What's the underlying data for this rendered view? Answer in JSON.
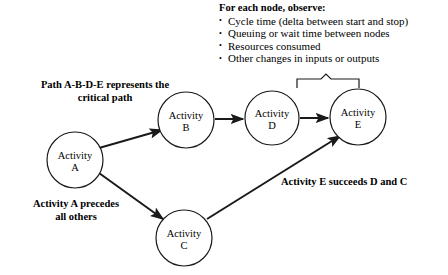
{
  "diagram": {
    "type": "process-flow-network",
    "stroke_color": "#1a1a1a",
    "node_fill": "#ffffff",
    "nodes": [
      {
        "id": "A",
        "line1": "Activity",
        "line2": "A",
        "cx": 75,
        "cy": 160,
        "r": 28
      },
      {
        "id": "B",
        "line1": "Activity",
        "line2": "B",
        "cx": 186,
        "cy": 120,
        "r": 28
      },
      {
        "id": "C",
        "line1": "Activity",
        "line2": "C",
        "cx": 184,
        "cy": 238,
        "r": 28
      },
      {
        "id": "D",
        "line1": "Activity",
        "line2": "D",
        "cx": 272,
        "cy": 118,
        "r": 27
      },
      {
        "id": "E",
        "line1": "Activity",
        "line2": "E",
        "cx": 358,
        "cy": 117,
        "r": 28
      }
    ],
    "edges": [
      {
        "from": "A",
        "to": "B",
        "x1": 99,
        "y1": 148,
        "x2": 162,
        "y2": 130
      },
      {
        "from": "A",
        "to": "C",
        "x1": 99,
        "y1": 173,
        "x2": 163,
        "y2": 219
      },
      {
        "from": "B",
        "to": "D",
        "x1": 215,
        "y1": 119,
        "x2": 243,
        "y2": 119
      },
      {
        "from": "D",
        "to": "E",
        "x1": 300,
        "y1": 118,
        "x2": 328,
        "y2": 118
      },
      {
        "from": "C",
        "to": "E",
        "x1": 207,
        "y1": 219,
        "x2": 340,
        "y2": 136
      }
    ],
    "bracket": {
      "label": "brace-over-d-and-e",
      "left_x": 297,
      "right_x": 359,
      "bar_y": 88,
      "tick_y": 79,
      "peak_x": 326,
      "peak_y": 74
    }
  },
  "annotations": {
    "critical_path": "Path A-B-D-E represents the\ncritical path",
    "precedes": "Activity A precedes\nall others",
    "succeeds": "Activity E succeeds D and C"
  },
  "observe": {
    "title": "For each node, observe:",
    "items": [
      "Cycle time (delta between start and stop)",
      "Queuing or wait time between nodes",
      "Resources consumed",
      "Other changes in inputs or outputs"
    ]
  }
}
